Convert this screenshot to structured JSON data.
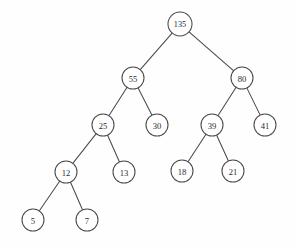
{
  "figure": {
    "kind": "binary-search-tree-diagram",
    "background_color": "#fefefe",
    "stroke_color": "#4a4a4a",
    "node_fill_color": "#ffffff",
    "label_color": "#2b2b2b",
    "width": 298,
    "height": 247
  },
  "tree": {
    "root_value": "135",
    "node_radius": 11,
    "root_radius": 12,
    "nodes": [
      {
        "id": "n135",
        "label": "135",
        "x": 180,
        "y": 24,
        "r": 12,
        "level": 0
      },
      {
        "id": "n55",
        "label": "55",
        "x": 133,
        "y": 78,
        "r": 11,
        "level": 1
      },
      {
        "id": "n80",
        "label": "80",
        "x": 242,
        "y": 78,
        "r": 11,
        "level": 1
      },
      {
        "id": "n25",
        "label": "25",
        "x": 103,
        "y": 125,
        "r": 11,
        "level": 2
      },
      {
        "id": "n30",
        "label": "30",
        "x": 157,
        "y": 125,
        "r": 11,
        "level": 2
      },
      {
        "id": "n39",
        "label": "39",
        "x": 212,
        "y": 125,
        "r": 11,
        "level": 2
      },
      {
        "id": "n41",
        "label": "41",
        "x": 265,
        "y": 125,
        "r": 11,
        "level": 2
      },
      {
        "id": "n12",
        "label": "12",
        "x": 66,
        "y": 172,
        "r": 11,
        "level": 3
      },
      {
        "id": "n13",
        "label": "13",
        "x": 124,
        "y": 172,
        "r": 11,
        "level": 3
      },
      {
        "id": "n18",
        "label": "18",
        "x": 182,
        "y": 171,
        "r": 11,
        "level": 3
      },
      {
        "id": "n21",
        "label": "21",
        "x": 233,
        "y": 171,
        "r": 11,
        "level": 3
      },
      {
        "id": "n5",
        "label": "5",
        "x": 33,
        "y": 220,
        "r": 11,
        "level": 4
      },
      {
        "id": "n7",
        "label": "7",
        "x": 87,
        "y": 220,
        "r": 11,
        "level": 4
      }
    ],
    "edges": [
      {
        "from": "n135",
        "to": "n55",
        "side": "left"
      },
      {
        "from": "n135",
        "to": "n80",
        "side": "right"
      },
      {
        "from": "n55",
        "to": "n25",
        "side": "left"
      },
      {
        "from": "n55",
        "to": "n30",
        "side": "right"
      },
      {
        "from": "n80",
        "to": "n39",
        "side": "left"
      },
      {
        "from": "n80",
        "to": "n41",
        "side": "right"
      },
      {
        "from": "n25",
        "to": "n12",
        "side": "left"
      },
      {
        "from": "n25",
        "to": "n13",
        "side": "right"
      },
      {
        "from": "n39",
        "to": "n18",
        "side": "left"
      },
      {
        "from": "n39",
        "to": "n21",
        "side": "right"
      },
      {
        "from": "n12",
        "to": "n5",
        "side": "left"
      },
      {
        "from": "n12",
        "to": "n7",
        "side": "right"
      }
    ]
  }
}
